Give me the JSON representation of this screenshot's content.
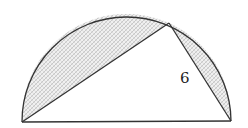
{
  "diagram": {
    "side_label": "6",
    "colors": {
      "stroke": "#333333",
      "hatch": "#b8b8b8",
      "shade_bg": "#f0f0f0"
    }
  }
}
